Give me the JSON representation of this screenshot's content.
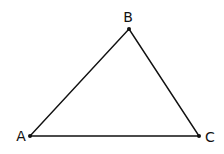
{
  "diagram": {
    "type": "triangle",
    "stroke_color": "#111111",
    "background": "#ffffff",
    "vertices": [
      {
        "id": "A",
        "label": "A",
        "x": 30,
        "y": 136,
        "label_x": 21,
        "label_y": 136
      },
      {
        "id": "B",
        "label": "B",
        "x": 129,
        "y": 29,
        "label_x": 128,
        "label_y": 17
      },
      {
        "id": "C",
        "label": "C",
        "x": 199,
        "y": 136,
        "label_x": 210,
        "label_y": 137
      }
    ],
    "edges": [
      {
        "from": "A",
        "to": "B"
      },
      {
        "from": "B",
        "to": "C"
      },
      {
        "from": "A",
        "to": "C"
      }
    ]
  }
}
